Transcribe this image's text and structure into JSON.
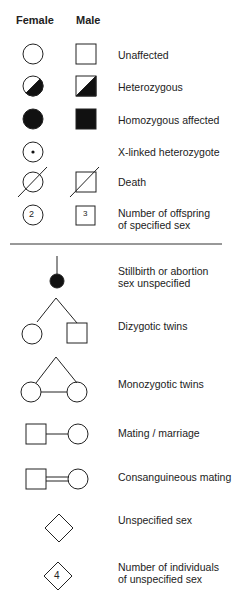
{
  "header": {
    "female": "Female",
    "male": "Male"
  },
  "rows": [
    {
      "label": "Unaffected"
    },
    {
      "label": "Heterozygous"
    },
    {
      "label": "Homozygous affected"
    },
    {
      "label": "X-linked heterozygote"
    },
    {
      "label": "Death"
    },
    {
      "label": "Number of offspring\nof specified sex",
      "female_count": "2",
      "male_count": "3"
    },
    {
      "label": "Stillbirth or abortion\nsex unspecified"
    },
    {
      "label": "Dizygotic twins"
    },
    {
      "label": "Monozygotic twins"
    },
    {
      "label": "Mating / marriage"
    },
    {
      "label": "Consanguineous mating"
    },
    {
      "label": "Unspecified sex"
    },
    {
      "label": "Number of individuals\nof unspecified sex",
      "count": "4"
    }
  ]
}
